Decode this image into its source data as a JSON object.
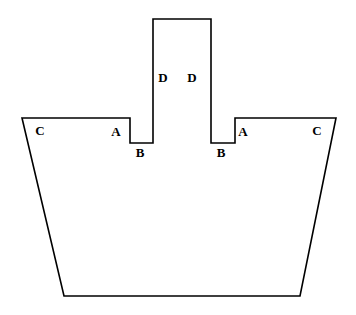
{
  "figure": {
    "canvas": {
      "width": 356,
      "height": 315
    },
    "background_color": "#ffffff",
    "stroke_color": "#000000",
    "fill_color": "#ffffff",
    "stroke_width": 1.6,
    "outline_points": "22,118 130,118 130,143 153,143 153,19 211,19 211,143 235,143 235,118 336,118 300,296 64,296",
    "vertices": [
      {
        "name": "hull-top-left",
        "x": 22,
        "y": 118
      },
      {
        "name": "left-notch-top-right",
        "x": 130,
        "y": 118
      },
      {
        "name": "left-notch-bottom-left",
        "x": 130,
        "y": 143
      },
      {
        "name": "left-notch-bottom-right",
        "x": 153,
        "y": 143
      },
      {
        "name": "tower-bottom-left",
        "x": 153,
        "y": 143
      },
      {
        "name": "tower-top-left",
        "x": 153,
        "y": 19
      },
      {
        "name": "tower-top-right",
        "x": 211,
        "y": 19
      },
      {
        "name": "tower-bottom-right",
        "x": 211,
        "y": 143
      },
      {
        "name": "right-notch-bottom-right",
        "x": 235,
        "y": 143
      },
      {
        "name": "right-notch-top-left",
        "x": 235,
        "y": 118
      },
      {
        "name": "hull-top-right",
        "x": 336,
        "y": 118
      },
      {
        "name": "hull-bottom-right",
        "x": 300,
        "y": 296
      },
      {
        "name": "hull-bottom-left",
        "x": 64,
        "y": 296
      }
    ],
    "labels": [
      {
        "id": "label-c-left",
        "text": "C",
        "x": 40,
        "y": 130
      },
      {
        "id": "label-a-left",
        "text": "A",
        "x": 116,
        "y": 131
      },
      {
        "id": "label-b-left",
        "text": "B",
        "x": 140,
        "y": 152
      },
      {
        "id": "label-d-left",
        "text": "D",
        "x": 163,
        "y": 77
      },
      {
        "id": "label-d-right",
        "text": "D",
        "x": 192,
        "y": 77
      },
      {
        "id": "label-b-right",
        "text": "B",
        "x": 221,
        "y": 152
      },
      {
        "id": "label-a-right",
        "text": "A",
        "x": 243,
        "y": 131
      },
      {
        "id": "label-c-right",
        "text": "C",
        "x": 317,
        "y": 130
      }
    ]
  }
}
